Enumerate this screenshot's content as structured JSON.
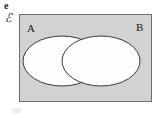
{
  "figure": {
    "part_label": "e",
    "universal_set_symbol": "ℰ",
    "set_a_label": "A",
    "set_b_label": "B",
    "colors": {
      "universe_fill": "#d2d2d2",
      "universe_border": "#6f6f6f",
      "ellipse_fill": "#fdfdfd",
      "ellipse_stroke": "#3a3a3a",
      "page_background": "#ffffff",
      "text": "#161616"
    }
  },
  "chart_data": {
    "type": "venn",
    "title": "",
    "universe": {
      "label": "ℰ",
      "shaded": true,
      "x": 19,
      "y": 14,
      "width": 133,
      "height": 88
    },
    "sets": [
      {
        "name": "A",
        "shape": "ellipse",
        "cx": 62,
        "cy": 61,
        "rx": 39,
        "ry": 25,
        "filled": false,
        "label_position": "top-left-inside-universe"
      },
      {
        "name": "B",
        "shape": "ellipse",
        "cx": 101,
        "cy": 61,
        "rx": 39,
        "ry": 25,
        "filled": false,
        "label_position": "top-right-inside-universe"
      }
    ],
    "regions_shaded": []
  }
}
